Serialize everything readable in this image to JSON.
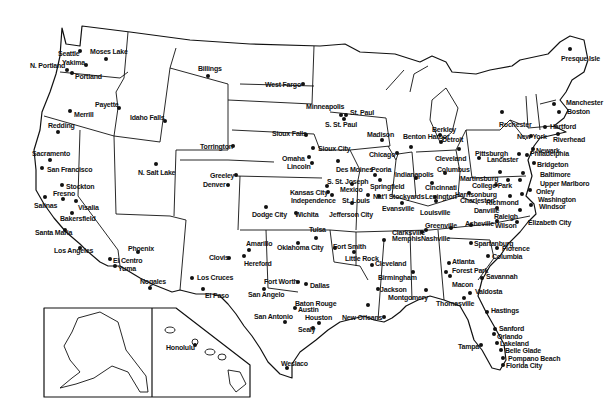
{
  "map": {
    "title": "",
    "background": "#ffffff",
    "line_color": "#111111",
    "insets": [
      {
        "name": "alaska",
        "label": ""
      },
      {
        "name": "hawaii",
        "label": "Honolulu"
      }
    ],
    "cities": [
      {
        "name": "Seattle",
        "x": 58,
        "y": 50,
        "dx": 80,
        "dy": 51,
        "dot": [
          80,
          51
        ]
      },
      {
        "name": "Moses Lake",
        "x": 90,
        "y": 48,
        "dot": [
          106,
          59
        ]
      },
      {
        "name": "Yakima",
        "x": 62,
        "y": 59,
        "dot": [
          86,
          65
        ]
      },
      {
        "name": "N. Portland",
        "x": 30,
        "y": 62,
        "dot": [
          67,
          70
        ]
      },
      {
        "name": "Portland",
        "x": 75,
        "y": 73,
        "dot": [
          72,
          73
        ]
      },
      {
        "name": "Payette",
        "x": 95,
        "y": 101,
        "dot": [
          119,
          108
        ]
      },
      {
        "name": "Merrill",
        "x": 74,
        "y": 111,
        "dot": [
          70,
          111
        ]
      },
      {
        "name": "Idaho Falls",
        "x": 130,
        "y": 114,
        "dot": [
          165,
          121
        ]
      },
      {
        "name": "Redding",
        "x": 48,
        "y": 122,
        "dot": [
          58,
          132
        ]
      },
      {
        "name": "Sacramento",
        "x": 32,
        "y": 150,
        "dot": [
          50,
          160
        ]
      },
      {
        "name": "San Francisco",
        "x": 47,
        "y": 166,
        "dot": [
          42,
          168
        ]
      },
      {
        "name": "Stockton",
        "x": 66,
        "y": 183,
        "dot": [
          62,
          185
        ]
      },
      {
        "name": "Fresno",
        "x": 53,
        "y": 190,
        "dot": [
          63,
          199
        ]
      },
      {
        "name": "Salinas",
        "x": 34,
        "y": 202,
        "dot": [
          45,
          197
        ]
      },
      {
        "name": "Visalia",
        "x": 78,
        "y": 204,
        "dot": [
          76,
          201
        ]
      },
      {
        "name": "Bakersfield",
        "x": 60,
        "y": 215,
        "dot": [
          72,
          213
        ]
      },
      {
        "name": "Santa Maria",
        "x": 35,
        "y": 229,
        "dot": [
          65,
          230
        ]
      },
      {
        "name": "Los Angeles",
        "x": 54,
        "y": 247,
        "dot": [
          80,
          248
        ]
      },
      {
        "name": "N. Salt Lake",
        "x": 138,
        "y": 169,
        "dot": [
          156,
          164
        ]
      },
      {
        "name": "Phoenix",
        "x": 128,
        "y": 245,
        "dot": [
          138,
          252
        ]
      },
      {
        "name": "El Centro",
        "x": 113,
        "y": 257,
        "dot": [
          110,
          259
        ]
      },
      {
        "name": "Yuma",
        "x": 118,
        "y": 265,
        "dot": [
          115,
          266
        ]
      },
      {
        "name": "Nogales",
        "x": 140,
        "y": 278,
        "dot": [
          150,
          288
        ]
      },
      {
        "name": "Billings",
        "x": 198,
        "y": 65,
        "dot": [
          208,
          76
        ]
      },
      {
        "name": "West Fargo",
        "x": 265,
        "y": 81,
        "dot": [
          303,
          84
        ]
      },
      {
        "name": "Minneapolis",
        "x": 306,
        "y": 103,
        "dot": [
          341,
          115
        ]
      },
      {
        "name": "St. Paul",
        "x": 350,
        "y": 109,
        "dot": [
          346,
          115
        ]
      },
      {
        "name": "S. St. Paul",
        "x": 325,
        "y": 121,
        "dot": [
          344,
          119
        ]
      },
      {
        "name": "Sioux Falls",
        "x": 272,
        "y": 130,
        "dot": [
          306,
          135
        ]
      },
      {
        "name": "Torrington",
        "x": 200,
        "y": 143,
        "dot": [
          233,
          146
        ]
      },
      {
        "name": "Sioux City",
        "x": 318,
        "y": 145,
        "dot": [
          313,
          148
        ]
      },
      {
        "name": "Omaha",
        "x": 282,
        "y": 155,
        "dot": [
          309,
          157
        ]
      },
      {
        "name": "Lincoln",
        "x": 287,
        "y": 163,
        "dot": [
          312,
          163
        ]
      },
      {
        "name": "Greeley",
        "x": 210,
        "y": 172,
        "dot": [
          236,
          175
        ]
      },
      {
        "name": "Denver",
        "x": 203,
        "y": 181,
        "dot": [
          228,
          185
        ]
      },
      {
        "name": "Dodge City",
        "x": 252,
        "y": 211,
        "dot": [
          266,
          207
        ]
      },
      {
        "name": "Wichita",
        "x": 295,
        "y": 211,
        "dot": [
          296,
          213
        ]
      },
      {
        "name": "Kansas City",
        "x": 290,
        "y": 189,
        "dot": [
          328,
          192
        ]
      },
      {
        "name": "Independence",
        "x": 291,
        "y": 197,
        "dot": [
          332,
          195
        ]
      },
      {
        "name": "Madison",
        "x": 367,
        "y": 131,
        "dot": [
          382,
          140
        ]
      },
      {
        "name": "Benton Harbor",
        "x": 403,
        "y": 133,
        "dot": [
          411,
          147
        ]
      },
      {
        "name": "Chicago",
        "x": 369,
        "y": 151,
        "dot": [
          397,
          153
        ]
      },
      {
        "name": "Des Moines",
        "x": 336,
        "y": 166,
        "dot": [
          338,
          161
        ]
      },
      {
        "name": "Peoria",
        "x": 371,
        "y": 166,
        "dot": [
          375,
          175
        ]
      },
      {
        "name": "S. St. Joseph",
        "x": 327,
        "y": 178,
        "dot": [
          327,
          186
        ]
      },
      {
        "name": "Mexico",
        "x": 340,
        "y": 186,
        "dot": [
          352,
          184
        ]
      },
      {
        "name": "Springfield",
        "x": 370,
        "y": 183,
        "dot": [
          380,
          180
        ]
      },
      {
        "name": "St. Louis",
        "x": 342,
        "y": 197,
        "dot": [
          368,
          195
        ]
      },
      {
        "name": "Jefferson City",
        "x": 329,
        "y": 211,
        "dot": [
          352,
          203
        ]
      },
      {
        "name": "Nat'l Stockyards",
        "x": 373,
        "y": 193,
        "dot": [
          379,
          196
        ]
      },
      {
        "name": "Indianapolis",
        "x": 395,
        "y": 171,
        "dot": [
          416,
          178
        ]
      },
      {
        "name": "Evansville",
        "x": 382,
        "y": 205,
        "dot": [
          402,
          203
        ]
      },
      {
        "name": "Louisville",
        "x": 420,
        "y": 209,
        "dot": [
          436,
          201
        ]
      },
      {
        "name": "Berkley",
        "x": 432,
        "y": 126,
        "dot": [
          440,
          135
        ]
      },
      {
        "name": "Detroit",
        "x": 442,
        "y": 136,
        "dot": [
          441,
          142
        ]
      },
      {
        "name": "Cleveland",
        "x": 435,
        "y": 155,
        "dot": [
          459,
          149
        ]
      },
      {
        "name": "Columbus",
        "x": 437,
        "y": 166,
        "dot": [
          445,
          173
        ]
      },
      {
        "name": "Cincinnati",
        "x": 425,
        "y": 184,
        "dot": [
          432,
          183
        ]
      },
      {
        "name": "Lexington",
        "x": 425,
        "y": 193,
        "dot": [
          435,
          197
        ]
      },
      {
        "name": "Pittsburgh",
        "x": 475,
        "y": 150,
        "dot": [
          479,
          158
        ]
      },
      {
        "name": "Lancaster",
        "x": 487,
        "y": 156,
        "dot": [
          519,
          154
        ]
      },
      {
        "name": "Rochester",
        "x": 499,
        "y": 121,
        "dot": [
          502,
          112
        ]
      },
      {
        "name": "New York",
        "x": 517,
        "y": 133,
        "dot": [
          531,
          136
        ]
      },
      {
        "name": "Riverhead",
        "x": 553,
        "y": 136,
        "dot": [
          558,
          134
        ]
      },
      {
        "name": "Newark",
        "x": 536,
        "y": 147,
        "dot": [
          533,
          149
        ]
      },
      {
        "name": "Philadelphia",
        "x": 530,
        "y": 150,
        "dot": [
          527,
          155
        ]
      },
      {
        "name": "Bridgeton",
        "x": 537,
        "y": 161,
        "dot": [
          534,
          163
        ]
      },
      {
        "name": "Baltimore",
        "x": 540,
        "y": 171,
        "dot": [
          523,
          173
        ]
      },
      {
        "name": "Upper Marlboro",
        "x": 540,
        "y": 180,
        "dot": [
          520,
          180
        ]
      },
      {
        "name": "Onley",
        "x": 536,
        "y": 188,
        "dot": [
          530,
          190
        ]
      },
      {
        "name": "Washington",
        "x": 538,
        "y": 196,
        "dot": [
          522,
          194
        ]
      },
      {
        "name": "Windsor",
        "x": 539,
        "y": 203,
        "dot": [
          531,
          205
        ]
      },
      {
        "name": "Martinsburg",
        "x": 460,
        "y": 175,
        "dot": [
          500,
          172
        ]
      },
      {
        "name": "College Park",
        "x": 472,
        "y": 182,
        "dot": [
          508,
          180
        ]
      },
      {
        "name": "Harrisonburg",
        "x": 455,
        "y": 191,
        "dot": [
          496,
          185
        ]
      },
      {
        "name": "Charleston",
        "x": 460,
        "y": 197,
        "dot": [
          469,
          193
        ]
      },
      {
        "name": "Richmond",
        "x": 486,
        "y": 199,
        "dot": [
          510,
          196
        ]
      },
      {
        "name": "Danville",
        "x": 474,
        "y": 207,
        "dot": [
          497,
          208
        ]
      },
      {
        "name": "Raleigh",
        "x": 494,
        "y": 213,
        "dot": [
          520,
          210
        ]
      },
      {
        "name": "Wilson",
        "x": 495,
        "y": 222,
        "dot": [
          497,
          221
        ]
      },
      {
        "name": "Elizabeth City",
        "x": 528,
        "y": 219,
        "dot": [
          517,
          222
        ]
      },
      {
        "name": "Greenville",
        "x": 425,
        "y": 222,
        "dot": [
          451,
          228
        ]
      },
      {
        "name": "Asheville",
        "x": 465,
        "y": 220,
        "dot": [
          471,
          225
        ]
      },
      {
        "name": "Manchester",
        "x": 566,
        "y": 99,
        "dot": [
          554,
          104
        ]
      },
      {
        "name": "Boston",
        "x": 567,
        "y": 108,
        "dot": [
          559,
          112
        ]
      },
      {
        "name": "Hartford",
        "x": 550,
        "y": 123,
        "dot": [
          545,
          127
        ]
      },
      {
        "name": "Presque Isle",
        "x": 561,
        "y": 55,
        "dot": [
          570,
          49
        ]
      },
      {
        "name": "Amarillo",
        "x": 246,
        "y": 240,
        "dot": [
          249,
          250
        ]
      },
      {
        "name": "Hereford",
        "x": 244,
        "y": 260,
        "dot": [
          244,
          256
        ]
      },
      {
        "name": "Clovis",
        "x": 209,
        "y": 254,
        "dot": [
          229,
          258
        ]
      },
      {
        "name": "Los Cruces",
        "x": 197,
        "y": 274,
        "dot": [
          192,
          278
        ]
      },
      {
        "name": "El Paso",
        "x": 205,
        "y": 292,
        "dot": [
          203,
          289
        ]
      },
      {
        "name": "Tulsa",
        "x": 309,
        "y": 226,
        "dot": [
          316,
          238
        ]
      },
      {
        "name": "Oklahoma City",
        "x": 277,
        "y": 244,
        "dot": [
          298,
          243
        ]
      },
      {
        "name": "Fort Worth",
        "x": 264,
        "y": 278,
        "dot": [
          298,
          282
        ]
      },
      {
        "name": "Dallas",
        "x": 310,
        "y": 282,
        "dot": [
          306,
          284
        ]
      },
      {
        "name": "San Angelo",
        "x": 248,
        "y": 291,
        "dot": [
          264,
          289
        ]
      },
      {
        "name": "Fort Smith",
        "x": 333,
        "y": 243,
        "dot": [
          335,
          248
        ]
      },
      {
        "name": "Little Rock",
        "x": 345,
        "y": 255,
        "dot": [
          354,
          252
        ]
      },
      {
        "name": "Clarksville",
        "x": 392,
        "y": 229,
        "dot": [
          422,
          232
        ]
      },
      {
        "name": "Memphis",
        "x": 392,
        "y": 235,
        "dot": [
          384,
          240
        ]
      },
      {
        "name": "Nashville",
        "x": 421,
        "y": 235,
        "dot": [
          426,
          230
        ]
      },
      {
        "name": "Cleveland",
        "x": 375,
        "y": 260,
        "dot": [
          372,
          265
        ]
      },
      {
        "name": "Birmingham",
        "x": 378,
        "y": 274,
        "dot": [
          413,
          272
        ]
      },
      {
        "name": "Jackson",
        "x": 380,
        "y": 286,
        "dot": [
          378,
          289
        ]
      },
      {
        "name": "Montgomery",
        "x": 388,
        "y": 294,
        "dot": [
          426,
          290
        ]
      },
      {
        "name": "Atlanta",
        "x": 452,
        "y": 258,
        "dot": [
          449,
          263
        ]
      },
      {
        "name": "Forest Park",
        "x": 452,
        "y": 267,
        "dot": [
          446,
          272
        ]
      },
      {
        "name": "Macon",
        "x": 452,
        "y": 281,
        "dot": [
          450,
          276
        ]
      },
      {
        "name": "Spartanburg",
        "x": 474,
        "y": 240,
        "dot": [
          471,
          243
        ]
      },
      {
        "name": "Florence",
        "x": 502,
        "y": 245,
        "dot": [
          497,
          248
        ]
      },
      {
        "name": "Columbia",
        "x": 492,
        "y": 253,
        "dot": [
          488,
          256
        ]
      },
      {
        "name": "Savannah",
        "x": 486,
        "y": 273,
        "dot": [
          482,
          278
        ]
      },
      {
        "name": "Valdosta",
        "x": 475,
        "y": 288,
        "dot": [
          470,
          293
        ]
      },
      {
        "name": "Thomasville",
        "x": 436,
        "y": 300,
        "dot": [
          464,
          298
        ]
      },
      {
        "name": "Baton Rouge",
        "x": 295,
        "y": 300,
        "dot": [
          368,
          305
        ]
      },
      {
        "name": "New Orleans",
        "x": 342,
        "y": 314,
        "dot": [
          384,
          317
        ]
      },
      {
        "name": "Austin",
        "x": 298,
        "y": 306,
        "dot": [
          295,
          308
        ]
      },
      {
        "name": "Houston",
        "x": 305,
        "y": 314,
        "dot": [
          319,
          323
        ]
      },
      {
        "name": "San Antonio",
        "x": 254,
        "y": 313,
        "dot": [
          285,
          322
        ]
      },
      {
        "name": "Sealy",
        "x": 298,
        "y": 326,
        "dot": [
          313,
          328
        ]
      },
      {
        "name": "Weslaco",
        "x": 281,
        "y": 360,
        "dot": [
          287,
          368
        ]
      },
      {
        "name": "Hastings",
        "x": 491,
        "y": 307,
        "dot": [
          487,
          312
        ]
      },
      {
        "name": "Sanford",
        "x": 499,
        "y": 325,
        "dot": [
          495,
          329
        ]
      },
      {
        "name": "Orlando",
        "x": 497,
        "y": 333,
        "dot": [
          494,
          334
        ]
      },
      {
        "name": "Lakeland",
        "x": 500,
        "y": 340,
        "dot": [
          497,
          343
        ]
      },
      {
        "name": "Tampa",
        "x": 458,
        "y": 343,
        "dot": [
          481,
          345
        ]
      },
      {
        "name": "Belle Glade",
        "x": 505,
        "y": 347,
        "dot": [
          501,
          350
        ]
      },
      {
        "name": "Pompano Beach",
        "x": 508,
        "y": 355,
        "dot": [
          503,
          358
        ]
      },
      {
        "name": "Florida City",
        "x": 506,
        "y": 362,
        "dot": [
          503,
          365
        ]
      },
      {
        "name": "Honolulu",
        "x": 166,
        "y": 344,
        "dot": [
          195,
          345
        ]
      }
    ]
  }
}
